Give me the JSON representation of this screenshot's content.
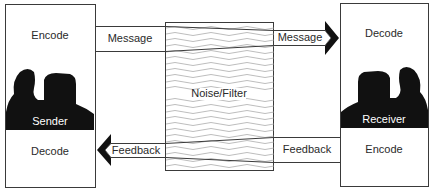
{
  "diagram": {
    "sender": {
      "top_label": "Encode",
      "name": "Sender",
      "bottom_label": "Decode"
    },
    "receiver": {
      "top_label": "Decode",
      "name": "Receiver",
      "bottom_label": "Encode"
    },
    "channel": {
      "label": "Noise/Filter"
    },
    "arrows": {
      "message_left": "Message",
      "message_right": "Message",
      "feedback_left": "Feedback",
      "feedback_right": "Feedback"
    },
    "colors": {
      "stroke": "#3a3a3a",
      "wave": "#9a9a9a",
      "silhouette": "#111111"
    }
  }
}
